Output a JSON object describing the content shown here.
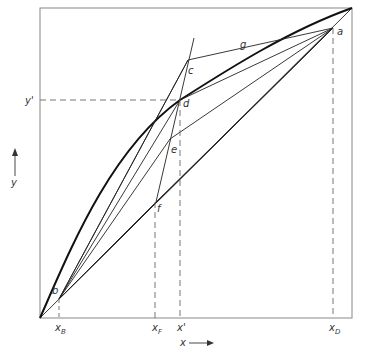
{
  "diagram": {
    "type": "McCabe-Thiele style x-y equilibrium diagram",
    "axes": {
      "x_label": "x",
      "y_label": "y",
      "x_ticks": [
        "x_B",
        "x_F",
        "x'",
        "x_D"
      ],
      "y_ticks": [
        "y'"
      ]
    },
    "points": {
      "a": "a",
      "b": "b",
      "c": "c",
      "d": "d",
      "e": "e",
      "f": "f",
      "g": "g"
    },
    "labels": {
      "x_axis": "x",
      "y_axis": "y",
      "xB_main": "x",
      "xB_sub": "B",
      "xF_main": "x",
      "xF_sub": "F",
      "xprime": "x'",
      "xD_main": "x",
      "xD_sub": "D",
      "yprime": "y'"
    },
    "colors": {
      "frame": "#888888",
      "curve": "#111111",
      "lines": "#222222",
      "dashed": "#666666"
    }
  }
}
